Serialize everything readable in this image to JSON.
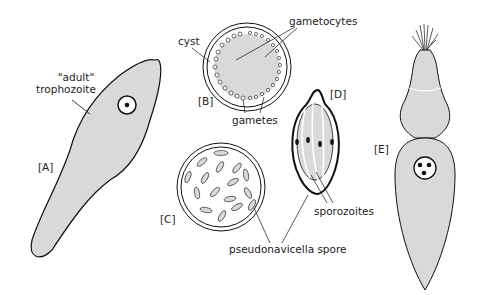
{
  "figure": {
    "panels": {
      "A": {
        "tag": "[A]",
        "label_line1": "\"adult\"",
        "label_line2": "trophozoite"
      },
      "B": {
        "tag": "[B]",
        "cyst": "cyst",
        "gametocytes": "gametocytes",
        "gametes": "gametes"
      },
      "C": {
        "tag": "[C]"
      },
      "D": {
        "tag": "[D]",
        "sporozoites": "sporozoites"
      },
      "E": {
        "tag": "[E]"
      }
    },
    "shared_label": "pseudonavicella spore",
    "colors": {
      "fill": "#d9d9d9",
      "stroke": "#111111",
      "background": "#ffffff"
    }
  }
}
